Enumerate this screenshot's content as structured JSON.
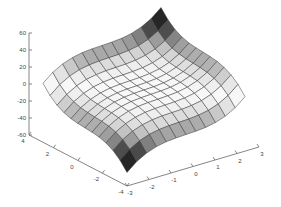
{
  "chart_data": {
    "type": "surface",
    "title": "",
    "xlabel": "",
    "ylabel": "",
    "zlabel": "",
    "grid": false,
    "colormap": "gray (dark at large |z|, light near 0)",
    "x": [
      -3,
      -2.5,
      -2,
      -1.5,
      -1,
      -0.5,
      0,
      0.5,
      1,
      1.5,
      2,
      2.5,
      3
    ],
    "y": [
      4,
      3.333,
      2.667,
      2,
      1.333,
      0.667,
      0,
      -0.667,
      -1.333,
      -2,
      -2.667,
      -3.333,
      -4
    ],
    "z": [
      [
        0.8,
        9.9,
        16.0,
        19.7,
        21.6,
        22.3,
        22.4,
        22.5,
        23.2,
        25.1,
        28.8,
        34.9,
        44.0
      ],
      [
        -8.6,
        0.5,
        6.6,
        10.3,
        12.2,
        12.9,
        13.0,
        13.1,
        13.8,
        15.7,
        19.4,
        25.5,
        34.6
      ],
      [
        -15.0,
        -5.9,
        0.2,
        3.9,
        5.8,
        6.5,
        6.6,
        6.7,
        7.4,
        9.3,
        13.0,
        19.1,
        28.2
      ],
      [
        -18.8,
        -9.7,
        -3.6,
        0.1,
        2.0,
        2.7,
        2.8,
        2.9,
        3.6,
        5.5,
        9.2,
        15.3,
        24.4
      ],
      [
        -20.8,
        -11.7,
        -5.6,
        -1.9,
        0.0,
        0.7,
        0.8,
        0.9,
        1.6,
        3.5,
        7.2,
        13.3,
        22.4
      ],
      [
        -21.5,
        -12.4,
        -6.3,
        -2.6,
        -0.7,
        0.0,
        0.1,
        0.2,
        0.9,
        2.8,
        6.5,
        12.6,
        21.7
      ],
      [
        -21.6,
        -12.5,
        -6.4,
        -2.7,
        -0.8,
        -0.1,
        0.0,
        0.1,
        0.8,
        2.7,
        6.4,
        12.5,
        21.6
      ],
      [
        -21.7,
        -12.6,
        -6.5,
        -2.8,
        -0.9,
        -0.2,
        -0.1,
        0.0,
        0.7,
        2.6,
        6.3,
        12.4,
        21.5
      ],
      [
        -22.4,
        -13.3,
        -7.2,
        -3.5,
        -1.6,
        -0.9,
        -0.8,
        -0.7,
        0.0,
        1.9,
        5.6,
        11.7,
        20.8
      ],
      [
        -24.4,
        -15.3,
        -9.2,
        -5.5,
        -3.6,
        -2.9,
        -2.8,
        -2.7,
        -2.0,
        -0.1,
        3.6,
        9.7,
        18.8
      ],
      [
        -28.2,
        -19.1,
        -13.0,
        -9.3,
        -7.4,
        -6.7,
        -6.6,
        -6.5,
        -5.8,
        -3.9,
        -0.2,
        5.9,
        15.0
      ],
      [
        -34.6,
        -25.5,
        -19.4,
        -15.7,
        -13.8,
        -13.1,
        -13.0,
        -12.9,
        -12.2,
        -10.3,
        -6.6,
        -0.5,
        8.6
      ],
      [
        -44.0,
        -34.9,
        -28.8,
        -25.1,
        -23.2,
        -22.5,
        -22.4,
        -22.3,
        -21.6,
        -19.7,
        -16.0,
        -9.9,
        -0.8
      ]
    ],
    "axes": {
      "z": {
        "ticks": [
          60,
          40,
          20,
          0,
          -20,
          -40,
          -60
        ],
        "tick_labels": [
          "60",
          "40",
          "20",
          "0",
          "-20",
          "-40",
          "-60"
        ],
        "range": [
          -60,
          60
        ]
      },
      "y": {
        "ticks": [
          4,
          2,
          0,
          -2,
          -4
        ],
        "tick_labels": [
          "4",
          "2",
          "0",
          "-2",
          "-4"
        ],
        "range": [
          -4,
          4
        ]
      },
      "x": {
        "ticks": [
          -3,
          -2,
          -1,
          0,
          1,
          2,
          3
        ],
        "tick_labels": [
          "-3",
          "-2",
          "-1",
          "0",
          "1",
          "2",
          "3"
        ],
        "range": [
          -3,
          3
        ]
      }
    }
  },
  "projection": {
    "origin": [
      29,
      135
    ],
    "y_axis_end": [
      127,
      186
    ],
    "x_axis_end": [
      259,
      147
    ],
    "z_top": [
      29,
      33
    ],
    "inset": {
      "left_corner_dx": 14,
      "right_corner_dx": -14
    }
  }
}
